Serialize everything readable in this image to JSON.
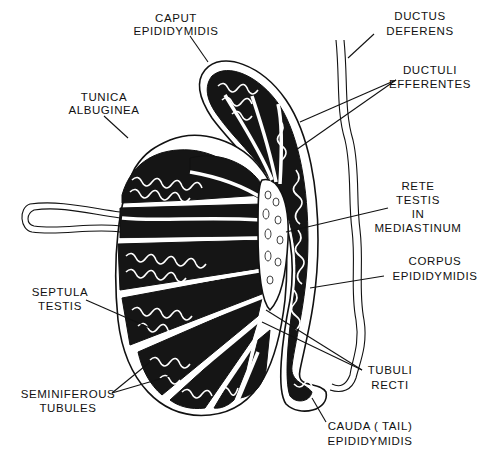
{
  "figure": {
    "labels": {
      "caput": [
        "CAPUT",
        "EPIDIDYMIDIS"
      ],
      "ductus_deferens": [
        "DUCTUS",
        "DEFERENS"
      ],
      "tunica_albuginea": [
        "TUNICA",
        "ALBUGINEA"
      ],
      "ductuli_efferentes": [
        "DUCTULI",
        "EFFERENTES"
      ],
      "rete_testis": [
        "RETE",
        "TESTIS",
        "IN",
        "MEDIASTINUM"
      ],
      "corpus": [
        "CORPUS",
        "EPIDIDYMIDIS"
      ],
      "septula_testis": [
        "SEPTULA",
        "TESTIS"
      ],
      "tubuli_recti": [
        "TUBULI",
        "RECTI"
      ],
      "seminiferous_tubules": [
        "SEMINIFEROUS",
        "TUBULES"
      ],
      "cauda": [
        "CAUDA ( TAIL)",
        "EPIDIDYMIDIS"
      ]
    }
  }
}
